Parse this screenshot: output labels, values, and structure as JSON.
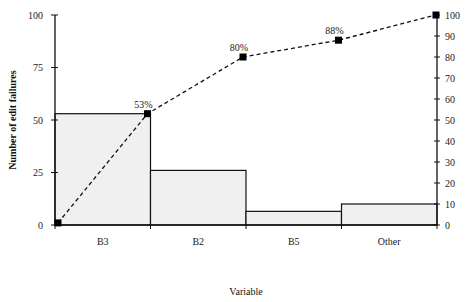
{
  "chart_data": {
    "type": "bar",
    "subtype": "pareto",
    "title": "",
    "xlabel": "Variable",
    "ylabel": "Number of edit failures",
    "categories": [
      "B3",
      "B2",
      "B5",
      "Other"
    ],
    "series": [
      {
        "name": "Number of edit failures",
        "type": "bar",
        "axis": "left",
        "values": [
          53,
          26,
          6.5,
          10
        ]
      },
      {
        "name": "Cumulative percent",
        "type": "line",
        "axis": "right",
        "x": [
          "start",
          "B3",
          "B2",
          "B5",
          "Other"
        ],
        "values": [
          1,
          53,
          80,
          88,
          100
        ]
      }
    ],
    "annotations": [
      {
        "label": "53%",
        "at": "B3"
      },
      {
        "label": "80%",
        "at": "B2"
      },
      {
        "label": "88%",
        "at": "B5"
      }
    ],
    "left_axis": {
      "ylim": [
        0,
        100
      ],
      "ticks": [
        0,
        25,
        50,
        75,
        100
      ]
    },
    "right_axis": {
      "ylim": [
        0,
        100
      ],
      "ticks": [
        0,
        10,
        20,
        30,
        40,
        50,
        60,
        70,
        80,
        90,
        100
      ]
    },
    "grid": false,
    "legend": "none",
    "colors": {
      "bar_fill": "#f0f0f0",
      "bar_stroke": "#111111",
      "line": "#111111",
      "marker": "#000000"
    }
  }
}
